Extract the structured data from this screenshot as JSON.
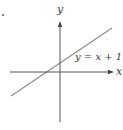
{
  "figure": {
    "marker": "•",
    "axes": {
      "x_label": "x",
      "y_label": "y"
    },
    "line": {
      "equation": "y = x + 1",
      "slope": 1,
      "intercept": 1
    },
    "colors": {
      "axis": "#555555",
      "line": "#8a8a8a",
      "text": "#3a3a3a",
      "background": "#ffffff"
    }
  }
}
